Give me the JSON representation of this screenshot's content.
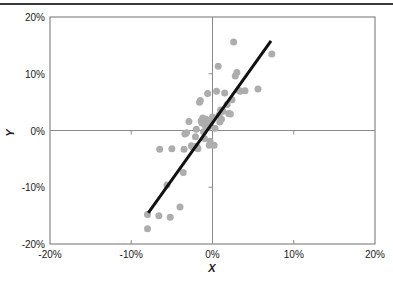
{
  "figure": {
    "top_rule_color": "#3a3a3a",
    "background": "#ffffff"
  },
  "chart_data": {
    "type": "scatter",
    "title": "",
    "xlabel": "X",
    "ylabel": "Y",
    "xlim": [
      -20,
      20
    ],
    "ylim": [
      -20,
      20
    ],
    "xticks": [
      -20,
      -10,
      0,
      10,
      20
    ],
    "yticks": [
      -20,
      -10,
      0,
      10,
      20
    ],
    "xtick_labels": [
      "-20%",
      "-10%",
      "0%",
      "10%",
      "20%"
    ],
    "ytick_labels": [
      "-20%",
      "-10%",
      "0%",
      "10%",
      "20%"
    ],
    "grid": false,
    "zero_lines": true,
    "legend": null,
    "marker_color": "#adadad",
    "marker_size": 7,
    "frame_color": "#707070",
    "axis_line_color": "#8a8a8a",
    "series": [
      {
        "name": "observations",
        "type": "scatter",
        "points": [
          [
            -8.0,
            -17.3
          ],
          [
            -8.0,
            -14.8
          ],
          [
            -6.6,
            -15.0
          ],
          [
            -5.2,
            -15.3
          ],
          [
            -4.0,
            -13.5
          ],
          [
            -3.6,
            -7.4
          ],
          [
            -5.6,
            -9.6
          ],
          [
            -6.5,
            -3.3
          ],
          [
            -5.0,
            -3.2
          ],
          [
            -3.5,
            -3.3
          ],
          [
            -3.4,
            -0.6
          ],
          [
            -3.2,
            -0.4
          ],
          [
            -2.9,
            1.6
          ],
          [
            -2.6,
            -2.7
          ],
          [
            -2.4,
            -3.0
          ],
          [
            -2.2,
            -2.8
          ],
          [
            -2.1,
            -1.1
          ],
          [
            -2.0,
            0.2
          ],
          [
            -1.9,
            -2.9
          ],
          [
            -1.8,
            -3.2
          ],
          [
            -1.6,
            5.0
          ],
          [
            -1.5,
            5.3
          ],
          [
            -1.4,
            1.7
          ],
          [
            -1.3,
            1.3
          ],
          [
            -1.2,
            2.2
          ],
          [
            -1.1,
            -0.2
          ],
          [
            -1.0,
            -1.4
          ],
          [
            -0.9,
            0.9
          ],
          [
            -0.8,
            2.0
          ],
          [
            -0.7,
            1.8
          ],
          [
            -0.6,
            6.5
          ],
          [
            -0.5,
            0.6
          ],
          [
            -0.4,
            -2.6
          ],
          [
            -0.3,
            -1.9
          ],
          [
            -0.2,
            1.5
          ],
          [
            0.0,
            2.4
          ],
          [
            0.2,
            -2.6
          ],
          [
            0.3,
            0.4
          ],
          [
            0.5,
            6.9
          ],
          [
            0.7,
            11.3
          ],
          [
            0.8,
            2.7
          ],
          [
            0.9,
            1.5
          ],
          [
            1.0,
            3.6
          ],
          [
            1.1,
            2.0
          ],
          [
            1.3,
            3.4
          ],
          [
            1.5,
            6.6
          ],
          [
            1.8,
            4.6
          ],
          [
            2.0,
            3.0
          ],
          [
            2.2,
            2.9
          ],
          [
            2.4,
            5.4
          ],
          [
            2.6,
            15.6
          ],
          [
            2.8,
            9.6
          ],
          [
            3.0,
            10.2
          ],
          [
            3.2,
            7.1
          ],
          [
            3.4,
            6.9
          ],
          [
            4.0,
            7.0
          ],
          [
            5.6,
            7.3
          ],
          [
            7.3,
            13.5
          ]
        ]
      },
      {
        "name": "trend-line",
        "type": "line",
        "points": [
          [
            -7.9,
            -14.5
          ],
          [
            7.2,
            15.8
          ]
        ],
        "color": "#111111",
        "width": 3
      }
    ]
  }
}
